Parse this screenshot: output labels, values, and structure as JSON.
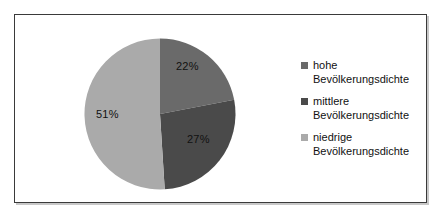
{
  "chart_data": {
    "type": "pie",
    "title": "",
    "categories": [
      "hohe Bevölkerungsdichte",
      "mittlere Bevölkerungsdichte",
      "niedrige Bevölkerungsdichte"
    ],
    "values": [
      22,
      27,
      51
    ],
    "value_labels": [
      "22%",
      "27%",
      "51%"
    ],
    "colors": [
      "#6a6a6a",
      "#4a4a4a",
      "#aaaaaa"
    ],
    "start_angle_deg": 0,
    "direction": "clockwise",
    "legend_position": "right",
    "grid": false
  },
  "chart": {
    "slices": [
      {
        "label": "22%",
        "name": "hohe Bevölkerungsdichte",
        "value": 22,
        "color": "#6a6a6a"
      },
      {
        "label": "27%",
        "name": "mittlere Bevölkerungsdichte",
        "value": 27,
        "color": "#4a4a4a"
      },
      {
        "label": "51%",
        "name": "niedrige Bevölkerungsdichte",
        "value": 51,
        "color": "#aaaaaa"
      }
    ]
  },
  "legend": {
    "items": [
      {
        "label": "hohe\nBevölkerungsdichte",
        "color": "#6a6a6a"
      },
      {
        "label": "mittlere\nBevölkerungsdichte",
        "color": "#4a4a4a"
      },
      {
        "label": "niedrige\nBevölkerungsdichte",
        "color": "#aaaaaa"
      }
    ]
  },
  "colors": {
    "frame_border": "#3a3a3a",
    "frame_shadow": "#c8c8c8",
    "background": "#ffffff",
    "text": "#111111"
  }
}
